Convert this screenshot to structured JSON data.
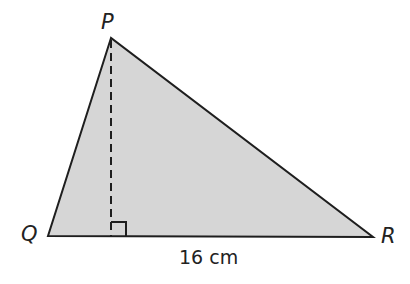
{
  "diagram": {
    "type": "triangle",
    "vertices": {
      "P": {
        "label": "P",
        "x": 111,
        "y": 38
      },
      "Q": {
        "label": "Q",
        "x": 48,
        "y": 236
      },
      "R": {
        "label": "R",
        "x": 373,
        "y": 237
      }
    },
    "altitude": {
      "from": "P",
      "foot_x": 111,
      "foot_y": 236,
      "style": "dashed",
      "right_angle_marker": true
    },
    "base_label": "16 cm",
    "colors": {
      "fill": "#d6d6d6",
      "stroke": "#1e1e1e",
      "text": "#222222"
    }
  }
}
